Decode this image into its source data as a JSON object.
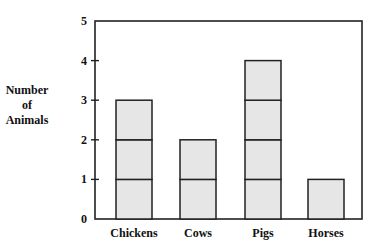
{
  "chart_data": {
    "type": "bar",
    "title": "",
    "xlabel": "",
    "ylabel": [
      "Number",
      "of",
      "Animals"
    ],
    "categories": [
      "Chickens",
      "Cows",
      "Pigs",
      "Horses"
    ],
    "values": [
      3,
      2,
      4,
      1
    ],
    "ylim": [
      0,
      5
    ],
    "yticks": [
      "0",
      "1",
      "2",
      "3",
      "4",
      "5"
    ],
    "grid": false,
    "style": "stacked unit boxes",
    "bar_color": "#e6e6e6"
  }
}
